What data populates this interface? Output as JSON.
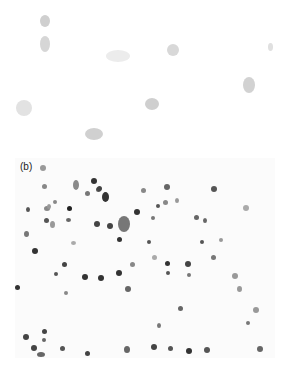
{
  "figure": {
    "panels": [
      {
        "id": "a",
        "label": "",
        "description": "micrograph with sparse faint gray cells",
        "cells": [
          {
            "x": 40,
            "y": 15,
            "w": 10,
            "h": 12,
            "c": "#cfcfcf"
          },
          {
            "x": 40,
            "y": 36,
            "w": 10,
            "h": 16,
            "c": "#d6d6d6"
          },
          {
            "x": 106,
            "y": 50,
            "w": 24,
            "h": 12,
            "c": "#ececec"
          },
          {
            "x": 167,
            "y": 44,
            "w": 12,
            "h": 12,
            "c": "#d8d8d8"
          },
          {
            "x": 268,
            "y": 43,
            "w": 5,
            "h": 8,
            "c": "#e0e0e0"
          },
          {
            "x": 243,
            "y": 77,
            "w": 12,
            "h": 16,
            "c": "#d2d2d2"
          },
          {
            "x": 145,
            "y": 98,
            "w": 14,
            "h": 12,
            "c": "#cfcfcf"
          },
          {
            "x": 16,
            "y": 100,
            "w": 16,
            "h": 16,
            "c": "#e2e2e2"
          },
          {
            "x": 85,
            "y": 128,
            "w": 18,
            "h": 12,
            "c": "#d0d0d0"
          }
        ]
      },
      {
        "id": "b",
        "label": "(b)",
        "description": "micrograph with many dark stained cells",
        "cells": [
          {
            "x": 58,
            "y": 22,
            "w": 6,
            "h": 10,
            "c": "#8a8a8a"
          },
          {
            "x": 76,
            "y": 20,
            "w": 6,
            "h": 6,
            "c": "#333"
          },
          {
            "x": 70,
            "y": 33,
            "w": 5,
            "h": 5,
            "c": "#777"
          },
          {
            "x": 87,
            "y": 34,
            "w": 7,
            "h": 10,
            "c": "#333"
          },
          {
            "x": 29,
            "y": 48,
            "w": 6,
            "h": 5,
            "c": "#888"
          },
          {
            "x": 52,
            "y": 48,
            "w": 5,
            "h": 5,
            "c": "#222"
          },
          {
            "x": 29,
            "y": 60,
            "w": 5,
            "h": 5,
            "c": "#555"
          },
          {
            "x": 35,
            "y": 63,
            "w": 5,
            "h": 7,
            "c": "#999"
          },
          {
            "x": 79,
            "y": 63,
            "w": 6,
            "h": 6,
            "c": "#444"
          },
          {
            "x": 92,
            "y": 65,
            "w": 6,
            "h": 6,
            "c": "#444"
          },
          {
            "x": 103,
            "y": 58,
            "w": 12,
            "h": 16,
            "c": "#777"
          },
          {
            "x": 119,
            "y": 51,
            "w": 6,
            "h": 6,
            "c": "#333"
          },
          {
            "x": 102,
            "y": 79,
            "w": 5,
            "h": 5,
            "c": "#333"
          },
          {
            "x": 9,
            "y": 73,
            "w": 5,
            "h": 6,
            "c": "#777"
          },
          {
            "x": 17,
            "y": 90,
            "w": 6,
            "h": 6,
            "c": "#333"
          },
          {
            "x": 56,
            "y": 83,
            "w": 5,
            "h": 4,
            "c": "#aaa"
          },
          {
            "x": 25,
            "y": 7,
            "w": 6,
            "h": 6,
            "c": "#999"
          },
          {
            "x": 27,
            "y": 26,
            "w": 5,
            "h": 5,
            "c": "#888"
          },
          {
            "x": 81,
            "y": 29,
            "w": 5,
            "h": 5,
            "c": "#555"
          },
          {
            "x": 11,
            "y": 49,
            "w": 4,
            "h": 5,
            "c": "#555"
          },
          {
            "x": 38,
            "y": 42,
            "w": 4,
            "h": 4,
            "c": "#888"
          },
          {
            "x": 51,
            "y": 60,
            "w": 5,
            "h": 4,
            "c": "#666"
          },
          {
            "x": 32,
            "y": 46,
            "w": 4,
            "h": 5,
            "c": "#999"
          },
          {
            "x": 82,
            "y": 28,
            "w": 5,
            "h": 5,
            "c": "#444"
          },
          {
            "x": 149,
            "y": 26,
            "w": 6,
            "h": 6,
            "c": "#666"
          },
          {
            "x": 115,
            "y": 104,
            "w": 5,
            "h": 5,
            "c": "#888"
          },
          {
            "x": 47,
            "y": 104,
            "w": 5,
            "h": 5,
            "c": "#444"
          },
          {
            "x": 39,
            "y": 114,
            "w": 4,
            "h": 4,
            "c": "#555"
          },
          {
            "x": 67,
            "y": 116,
            "w": 6,
            "h": 6,
            "c": "#333"
          },
          {
            "x": 83,
            "y": 117,
            "w": 6,
            "h": 6,
            "c": "#333"
          },
          {
            "x": 101,
            "y": 112,
            "w": 6,
            "h": 6,
            "c": "#333"
          },
          {
            "x": 110,
            "y": 128,
            "w": 6,
            "h": 6,
            "c": "#666"
          },
          {
            "x": 49,
            "y": 133,
            "w": 4,
            "h": 4,
            "c": "#888"
          },
          {
            "x": 0,
            "y": 127,
            "w": 5,
            "h": 5,
            "c": "#333"
          },
          {
            "x": 8,
            "y": 176,
            "w": 6,
            "h": 6,
            "c": "#444"
          },
          {
            "x": 27,
            "y": 171,
            "w": 5,
            "h": 5,
            "c": "#444"
          },
          {
            "x": 27,
            "y": 180,
            "w": 4,
            "h": 4,
            "c": "#666"
          },
          {
            "x": 16,
            "y": 187,
            "w": 6,
            "h": 6,
            "c": "#444"
          },
          {
            "x": 22,
            "y": 194,
            "w": 8,
            "h": 5,
            "c": "#666"
          },
          {
            "x": 45,
            "y": 188,
            "w": 5,
            "h": 5,
            "c": "#555"
          },
          {
            "x": 70,
            "y": 193,
            "w": 5,
            "h": 5,
            "c": "#444"
          },
          {
            "x": 109,
            "y": 188,
            "w": 6,
            "h": 7,
            "c": "#666"
          },
          {
            "x": 136,
            "y": 186,
            "w": 6,
            "h": 6,
            "c": "#444"
          },
          {
            "x": 153,
            "y": 188,
            "w": 5,
            "h": 5,
            "c": "#555"
          },
          {
            "x": 171,
            "y": 190,
            "w": 6,
            "h": 6,
            "c": "#333"
          },
          {
            "x": 189,
            "y": 189,
            "w": 6,
            "h": 6,
            "c": "#555"
          },
          {
            "x": 142,
            "y": 165,
            "w": 4,
            "h": 5,
            "c": "#777"
          },
          {
            "x": 163,
            "y": 148,
            "w": 5,
            "h": 5,
            "c": "#666"
          },
          {
            "x": 150,
            "y": 103,
            "w": 5,
            "h": 5,
            "c": "#333"
          },
          {
            "x": 170,
            "y": 103,
            "w": 6,
            "h": 6,
            "c": "#444"
          },
          {
            "x": 172,
            "y": 115,
            "w": 4,
            "h": 4,
            "c": "#777"
          },
          {
            "x": 151,
            "y": 113,
            "w": 4,
            "h": 4,
            "c": "#555"
          },
          {
            "x": 196,
            "y": 97,
            "w": 5,
            "h": 5,
            "c": "#777"
          },
          {
            "x": 126,
            "y": 30,
            "w": 5,
            "h": 5,
            "c": "#888"
          },
          {
            "x": 148,
            "y": 42,
            "w": 5,
            "h": 5,
            "c": "#888"
          },
          {
            "x": 160,
            "y": 40,
            "w": 4,
            "h": 5,
            "c": "#999"
          },
          {
            "x": 196,
            "y": 28,
            "w": 6,
            "h": 6,
            "c": "#555"
          },
          {
            "x": 179,
            "y": 57,
            "w": 5,
            "h": 5,
            "c": "#666"
          },
          {
            "x": 188,
            "y": 60,
            "w": 4,
            "h": 5,
            "c": "#666"
          },
          {
            "x": 136,
            "y": 58,
            "w": 4,
            "h": 4,
            "c": "#777"
          },
          {
            "x": 185,
            "y": 82,
            "w": 4,
            "h": 4,
            "c": "#555"
          },
          {
            "x": 132,
            "y": 82,
            "w": 4,
            "h": 4,
            "c": "#555"
          },
          {
            "x": 204,
            "y": 80,
            "w": 4,
            "h": 4,
            "c": "#999"
          },
          {
            "x": 141,
            "y": 46,
            "w": 4,
            "h": 4,
            "c": "#555"
          },
          {
            "x": 228,
            "y": 47,
            "w": 6,
            "h": 6,
            "c": "#aaa"
          },
          {
            "x": 137,
            "y": 97,
            "w": 5,
            "h": 5,
            "c": "#aaa"
          },
          {
            "x": 217,
            "y": 115,
            "w": 6,
            "h": 6,
            "c": "#999"
          },
          {
            "x": 222,
            "y": 128,
            "w": 5,
            "h": 6,
            "c": "#999"
          },
          {
            "x": 238,
            "y": 149,
            "w": 6,
            "h": 6,
            "c": "#999"
          },
          {
            "x": 242,
            "y": 188,
            "w": 6,
            "h": 6,
            "c": "#666"
          },
          {
            "x": 231,
            "y": 163,
            "w": 4,
            "h": 4,
            "c": "#777"
          }
        ]
      }
    ]
  }
}
